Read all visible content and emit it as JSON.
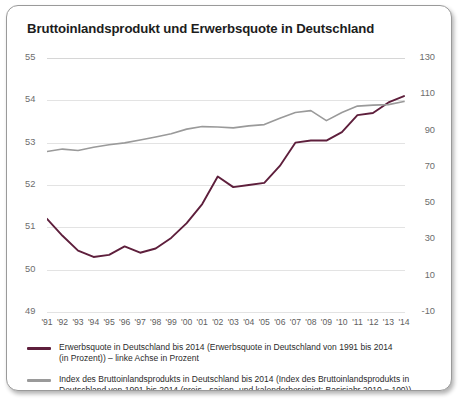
{
  "title": "Bruttoinlandsprodukt und Erwerbsquote in Deutschland",
  "colors": {
    "series1": "#5e1f3c",
    "series2": "#9a9a9a",
    "grid": "#e3e3e3",
    "axis_text": "#6d6d6d",
    "frame": "#9a9a9a"
  },
  "legend": [
    {
      "key": "series1",
      "line1": "Erwerbsquote in Deutschland bis 2014 (Erwerbsquote in Deutschland von 1991 bis 2014",
      "line2": "(in Prozent)) – linke Achse in Prozent"
    },
    {
      "key": "series2",
      "line1": "Index des Bruttoinlandsprodukts in Deutschland bis 2014 (Index des Bruttoinlandsprodukts in",
      "line2": "Deutschland von 1991 bis 2014 (preis-, saison- und kalenderbereinigt; Basisjahr 2010 = 100)) – rechte Achse"
    }
  ],
  "chart_data": {
    "type": "line",
    "title": "Bruttoinlandsprodukt und Erwerbsquote in Deutschland",
    "xlabel": "",
    "ylabel": "",
    "grid": true,
    "legend_position": "bottom",
    "x": [
      "1991",
      "1992",
      "1993",
      "1994",
      "1995",
      "1996",
      "1997",
      "1998",
      "1999",
      "2000",
      "2001",
      "2002",
      "2003",
      "2004",
      "2005",
      "2006",
      "2007",
      "2008",
      "2009",
      "2010",
      "2011",
      "2012",
      "2013",
      "2014"
    ],
    "categories": [
      "'91",
      "'92",
      "'93",
      "'94",
      "'95",
      "'96",
      "'97",
      "'98",
      "'99",
      "'00",
      "'01",
      "'02",
      "'03",
      "'04",
      "'05",
      "'06",
      "'07",
      "'08",
      "'09",
      "'10",
      "'11",
      "'12",
      "'13",
      "'14"
    ],
    "axes": {
      "left": {
        "label": "Erwerbsquote in Prozent",
        "ticks": [
          55,
          54,
          53,
          52,
          51,
          50,
          49
        ],
        "ylim": [
          49,
          55
        ]
      },
      "right": {
        "label": "Index des Bruttoinlandsprodukts (2010 = 100)",
        "ticks": [
          130,
          110,
          90,
          70,
          50,
          30,
          10,
          -10
        ],
        "ylim": [
          -10,
          130
        ]
      }
    },
    "series": [
      {
        "name": "Erwerbsquote in Deutschland bis 2014 (in Prozent)",
        "axis": "left",
        "color": "#5e1f3c",
        "values": [
          51.2,
          50.8,
          50.45,
          50.3,
          50.35,
          50.55,
          50.4,
          50.5,
          50.75,
          51.1,
          51.55,
          52.2,
          51.95,
          52.0,
          52.05,
          52.45,
          53.0,
          53.05,
          53.05,
          53.25,
          53.65,
          53.7,
          53.95,
          54.1
        ]
      },
      {
        "name": "Index des Bruttoinlandsprodukts in Deutschland bis 2014 (2010 = 100)",
        "axis": "right",
        "color": "#9a9a9a",
        "values": [
          78.5,
          79.8,
          79.0,
          80.8,
          82.2,
          83.2,
          84.8,
          86.5,
          88.2,
          90.8,
          92.2,
          92.0,
          91.5,
          92.6,
          93.3,
          96.8,
          100.0,
          101.0,
          95.5,
          100.0,
          103.5,
          104.0,
          104.3,
          106.0
        ]
      }
    ]
  }
}
